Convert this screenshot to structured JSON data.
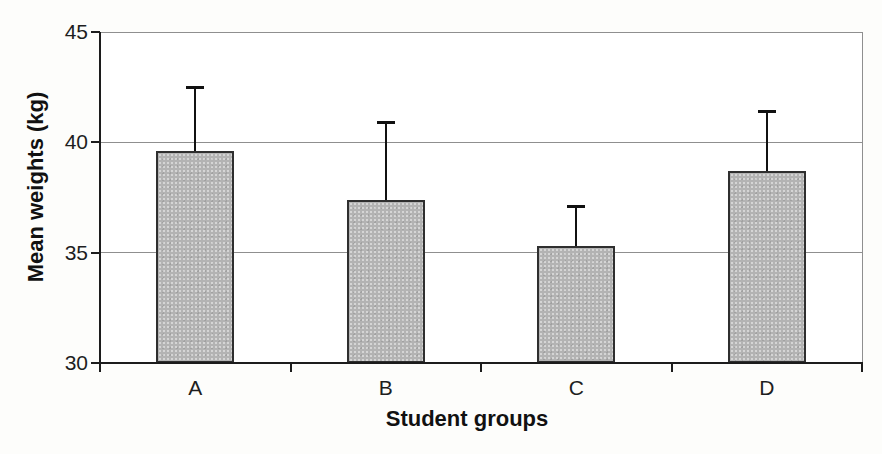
{
  "chart_data": {
    "type": "bar",
    "title": "",
    "xlabel": "Student groups",
    "ylabel": "Mean weights (kg)",
    "categories": [
      "A",
      "B",
      "C",
      "D"
    ],
    "series": [
      {
        "name": "Mean weights",
        "values": [
          39.6,
          37.4,
          35.3,
          38.7
        ],
        "errors_plus": [
          2.9,
          3.5,
          1.8,
          2.7
        ]
      }
    ],
    "ylim": [
      30,
      45
    ],
    "yticks": [
      30,
      35,
      40,
      45
    ],
    "grid": "horizontal",
    "legend": "none",
    "error_bars": "plus-only",
    "colors": {
      "bar_fill": "#b3b3b3",
      "bar_border": "#2f2f2f",
      "gridline": "#8f8f8f",
      "axis": "#1c1c1c",
      "error_bar": "#111111",
      "text": "#1e1e1e",
      "plot_bg": "#ffffff",
      "page_bg": "#fdfdfb"
    }
  }
}
